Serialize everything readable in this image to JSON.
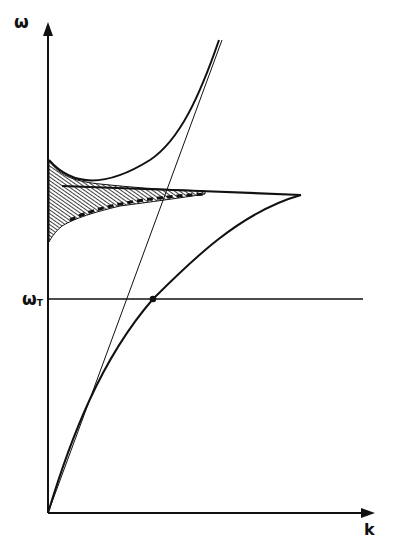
{
  "diagram": {
    "type": "dispersion-relation",
    "axes": {
      "y_label": "ω",
      "x_label": "k",
      "reference_line_label": "ω",
      "reference_line_subscript": "T"
    },
    "elements": [
      {
        "name": "light-line",
        "description": "straight line from origin (ω = ck)"
      },
      {
        "name": "lower-polariton-branch",
        "description": "curve from origin bending and approaching the horizontal asymptote"
      },
      {
        "name": "upper-polariton-branch",
        "description": "curve starting on ω axis, rising to meet light line asymptotically"
      },
      {
        "name": "horizontal-asymptote",
        "description": "horizontal line with dashed/hatched damping region"
      },
      {
        "name": "omega-t-line",
        "description": "horizontal line at ωT crossing lower branch"
      },
      {
        "name": "intersection-point",
        "description": "dot where light line meets lower branch at ωT"
      },
      {
        "name": "hatched-region",
        "description": "shaded band near ω axis between the branches"
      }
    ],
    "caption": "Fig. ... (caption text cut off at bottom of image)"
  },
  "colors": {
    "ink": "#111111",
    "background": "#ffffff"
  }
}
